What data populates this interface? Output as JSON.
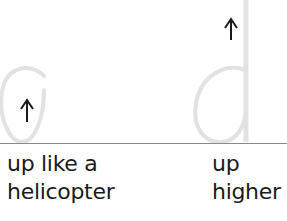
{
  "figure": {
    "left_stroke": {
      "letter_shape": "a",
      "arrow_icon": "up-arrow",
      "arrow_glyph": "↑",
      "caption_line1": "up like a",
      "caption_line2": "helicopter"
    },
    "right_stroke": {
      "letter_shape": "d",
      "arrow_icon": "up-arrow",
      "arrow_glyph": "↑",
      "caption_line1": "up",
      "caption_line2": "higher"
    },
    "colors": {
      "guide_stroke": "#e2e2e2",
      "arrow": "#1a1a1a",
      "baseline": "#8a8a8a",
      "text": "#1a1a1a"
    }
  }
}
